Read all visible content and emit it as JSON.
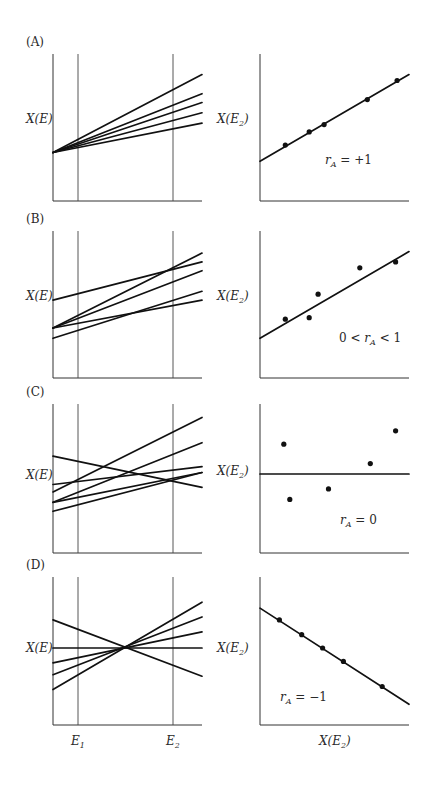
{
  "chart_data": [
    {
      "panel": "A",
      "type": "line",
      "label": "(A)",
      "ylabel": "X(E)",
      "xticks": [
        "E1",
        "E2"
      ],
      "description": "Reaction norms diverging from common intercept, all positive slopes",
      "series": [
        {
          "name": "genotype-1",
          "values": [
            0.33,
            0.86
          ]
        },
        {
          "name": "genotype-2",
          "values": [
            0.33,
            0.73
          ]
        },
        {
          "name": "genotype-3",
          "values": [
            0.33,
            0.67
          ]
        },
        {
          "name": "genotype-4",
          "values": [
            0.33,
            0.6
          ]
        },
        {
          "name": "genotype-5",
          "values": [
            0.33,
            0.53
          ]
        }
      ],
      "x": [
        0,
        1
      ],
      "ylim": [
        0,
        1
      ]
    },
    {
      "panel": "A",
      "type": "scatter",
      "ylabel": "X(E2)",
      "annotation": {
        "var": "r",
        "sub": "A",
        "rel": "= +1"
      },
      "points": [
        [
          0.17,
          0.38
        ],
        [
          0.33,
          0.47
        ],
        [
          0.43,
          0.52
        ],
        [
          0.72,
          0.69
        ],
        [
          0.92,
          0.82
        ]
      ],
      "fit_line": [
        [
          0,
          0.27
        ],
        [
          1,
          0.86
        ]
      ],
      "xlim": [
        0,
        1
      ],
      "ylim": [
        0,
        1
      ]
    },
    {
      "panel": "B",
      "type": "line",
      "label": "(B)",
      "ylabel": "X(E)",
      "series": [
        {
          "name": "genotype-1",
          "values": [
            0.53,
            0.79
          ]
        },
        {
          "name": "genotype-2",
          "values": [
            0.34,
            0.85
          ]
        },
        {
          "name": "genotype-3",
          "values": [
            0.34,
            0.73
          ]
        },
        {
          "name": "genotype-4",
          "values": [
            0.34,
            0.53
          ]
        },
        {
          "name": "genotype-5",
          "values": [
            0.27,
            0.59
          ]
        }
      ],
      "x": [
        0,
        1
      ],
      "ylim": [
        0,
        1
      ]
    },
    {
      "panel": "B",
      "type": "scatter",
      "ylabel": "X(E2)",
      "annotation": {
        "pre": "0 <",
        "var": "r",
        "sub": "A",
        "rel": "< 1"
      },
      "points": [
        [
          0.17,
          0.4
        ],
        [
          0.33,
          0.41
        ],
        [
          0.39,
          0.57
        ],
        [
          0.67,
          0.75
        ],
        [
          0.91,
          0.79
        ]
      ],
      "fit_line": [
        [
          0,
          0.27
        ],
        [
          1,
          0.86
        ]
      ],
      "xlim": [
        0,
        1
      ],
      "ylim": [
        0,
        1
      ]
    },
    {
      "panel": "C",
      "type": "line",
      "label": "(C)",
      "ylabel": "X(E)",
      "series": [
        {
          "name": "genotype-1",
          "values": [
            0.65,
            0.44
          ]
        },
        {
          "name": "genotype-2",
          "values": [
            0.46,
            0.58
          ]
        },
        {
          "name": "genotype-3",
          "values": [
            0.41,
            0.91
          ]
        },
        {
          "name": "genotype-4",
          "values": [
            0.34,
            0.74
          ]
        },
        {
          "name": "genotype-5",
          "values": [
            0.34,
            0.54
          ]
        },
        {
          "name": "genotype-6",
          "values": [
            0.28,
            0.54
          ]
        }
      ],
      "x": [
        0,
        1
      ],
      "ylim": [
        0,
        1
      ]
    },
    {
      "panel": "C",
      "type": "scatter",
      "ylabel": "X(E2)",
      "annotation": {
        "var": "r",
        "sub": "A",
        "rel": "= 0"
      },
      "points": [
        [
          0.16,
          0.73
        ],
        [
          0.2,
          0.36
        ],
        [
          0.46,
          0.43
        ],
        [
          0.74,
          0.6
        ],
        [
          0.91,
          0.82
        ]
      ],
      "fit_line": [
        [
          0,
          0.53
        ],
        [
          1,
          0.53
        ]
      ],
      "xlim": [
        0,
        1
      ],
      "ylim": [
        0,
        1
      ]
    },
    {
      "panel": "D",
      "type": "line",
      "label": "(D)",
      "ylabel": "X(E)",
      "series": [
        {
          "name": "genotype-1",
          "values": [
            0.71,
            0.33
          ]
        },
        {
          "name": "genotype-2",
          "values": [
            0.52,
            0.52
          ]
        },
        {
          "name": "genotype-3",
          "values": [
            0.42,
            0.63
          ]
        },
        {
          "name": "genotype-4",
          "values": [
            0.34,
            0.73
          ]
        },
        {
          "name": "genotype-5",
          "values": [
            0.24,
            0.83
          ]
        }
      ],
      "x": [
        0,
        1
      ],
      "ylim": [
        0,
        1
      ]
    },
    {
      "panel": "D",
      "type": "scatter",
      "ylabel": "X(E2)",
      "xlabel": "X(E2)",
      "annotation": {
        "var": "r",
        "sub": "A",
        "rel": "= −1"
      },
      "points": [
        [
          0.13,
          0.71
        ],
        [
          0.28,
          0.61
        ],
        [
          0.42,
          0.52
        ],
        [
          0.56,
          0.43
        ],
        [
          0.82,
          0.26
        ]
      ],
      "fit_line": [
        [
          0,
          0.79
        ],
        [
          1,
          0.14
        ]
      ],
      "xlim": [
        0,
        1
      ],
      "ylim": [
        0,
        1
      ]
    }
  ],
  "xtick_labels": {
    "e1": {
      "main": "E",
      "sub": "1"
    },
    "e2": {
      "main": "E",
      "sub": "2"
    }
  },
  "right_xlabel": {
    "main": "X(E",
    "sub": "2",
    "close": ")"
  }
}
